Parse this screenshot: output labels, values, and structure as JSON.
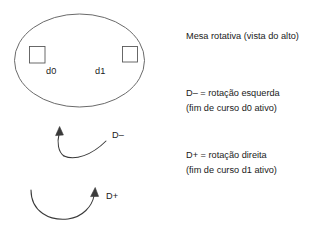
{
  "diagram": {
    "title": "Mesa rotativa (vista do alto)",
    "table": {
      "shape": "ellipse",
      "sensors": [
        {
          "id": "d0",
          "label": "d0",
          "position": "left"
        },
        {
          "id": "d1",
          "label": "d1",
          "position": "right"
        }
      ]
    },
    "arrows": [
      {
        "id": "d-minus",
        "label": "D–",
        "direction": "counterclockwise",
        "meaning": "rotação esquerda"
      },
      {
        "id": "d-plus",
        "label": "D+",
        "direction": "clockwise",
        "meaning": "rotação direita"
      }
    ],
    "notes": {
      "left_rotation": {
        "line1": "D– = rotação esquerda",
        "line2": "(fim de curso d0 ativo)"
      },
      "right_rotation": {
        "line1": "D+ = rotação direita",
        "line2": "(fim de curso d1 ativo)"
      }
    },
    "colors": {
      "stroke": "#595959",
      "text": "#1a1a1a",
      "background": "#ffffff"
    }
  }
}
